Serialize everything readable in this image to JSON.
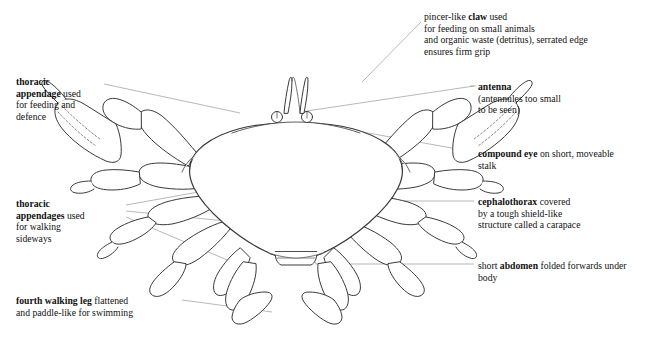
{
  "figure": {
    "line_color": "#3a3a3a",
    "leader_color": "#8a8a8a",
    "fill_color": "#ffffff",
    "background": "#ffffff"
  },
  "labels": {
    "claw": {
      "name": "claw-label",
      "lines": [
        [
          {
            "t": "pincer-like ",
            "b": false
          },
          {
            "t": "claw",
            "b": true
          },
          {
            "t": " used",
            "b": false
          }
        ],
        [
          {
            "t": "for feeding on small animals",
            "b": false
          }
        ],
        [
          {
            "t": "and organic waste (detritus), serrated edge",
            "b": false
          }
        ],
        [
          {
            "t": "ensures firm grip",
            "b": false
          }
        ]
      ]
    },
    "antenna": {
      "name": "antenna-label",
      "lines": [
        [
          {
            "t": "antenna",
            "b": true
          }
        ],
        [
          {
            "t": "(antennules too small",
            "b": false
          }
        ],
        [
          {
            "t": "to be seen)",
            "b": false
          }
        ]
      ]
    },
    "compound_eye": {
      "name": "compound-eye-label",
      "lines": [
        [
          {
            "t": "compound eye",
            "b": true
          },
          {
            "t": " on short, moveable",
            "b": false
          }
        ],
        [
          {
            "t": "stalk",
            "b": false
          }
        ]
      ]
    },
    "cephalothorax": {
      "name": "cephalothorax-label",
      "lines": [
        [
          {
            "t": "cephalothorax",
            "b": true
          },
          {
            "t": " covered",
            "b": false
          }
        ],
        [
          {
            "t": "by a tough shield-like",
            "b": false
          }
        ],
        [
          {
            "t": "structure called a carapace",
            "b": false
          }
        ]
      ]
    },
    "abdomen": {
      "name": "abdomen-label",
      "lines": [
        [
          {
            "t": "short ",
            "b": false
          },
          {
            "t": "abdomen",
            "b": true
          },
          {
            "t": " folded forwards under",
            "b": false
          }
        ],
        [
          {
            "t": "body",
            "b": false
          }
        ]
      ]
    },
    "thoracic_appendage": {
      "name": "thoracic-appendage-label",
      "lines": [
        [
          {
            "t": "thoracic",
            "b": true
          }
        ],
        [
          {
            "t": "appendage",
            "b": true
          },
          {
            "t": " used",
            "b": false
          }
        ],
        [
          {
            "t": "for feeding and",
            "b": false
          }
        ],
        [
          {
            "t": "defence",
            "b": false
          }
        ]
      ]
    },
    "thoracic_appendages": {
      "name": "thoracic-appendages-label",
      "lines": [
        [
          {
            "t": "thoracic",
            "b": true
          }
        ],
        [
          {
            "t": "appendages",
            "b": true
          },
          {
            "t": " used",
            "b": false
          }
        ],
        [
          {
            "t": "for walking",
            "b": false
          }
        ],
        [
          {
            "t": "sideways",
            "b": false
          }
        ]
      ]
    },
    "fourth_walking_leg": {
      "name": "fourth-walking-leg-label",
      "lines": [
        [
          {
            "t": "fourth walking leg",
            "b": true
          },
          {
            "t": " flattened",
            "b": false
          }
        ],
        [
          {
            "t": "and paddle-like for swimming",
            "b": false
          }
        ]
      ]
    }
  }
}
